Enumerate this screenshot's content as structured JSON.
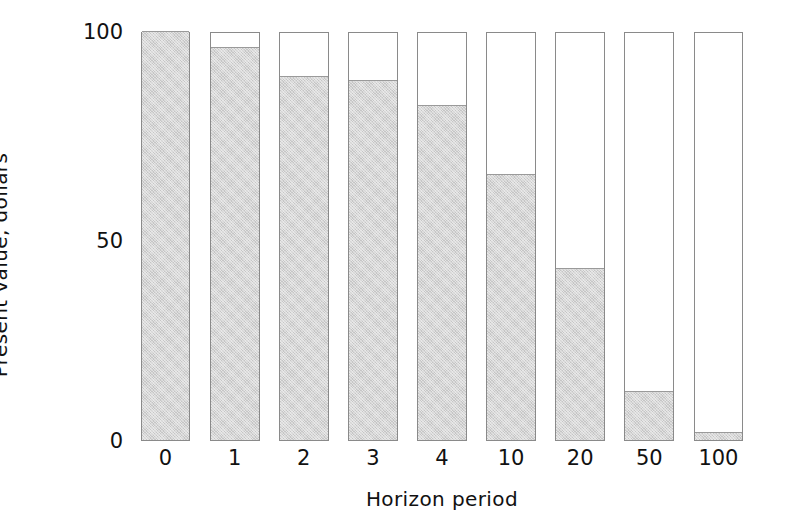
{
  "chart_data": {
    "type": "bar",
    "title": "",
    "subtitle": "",
    "xlabel": "Horizon period",
    "ylabel": "Present value, dollars",
    "categories": [
      "0",
      "1",
      "2",
      "3",
      "4",
      "10",
      "20",
      "50",
      "100"
    ],
    "values": [
      100,
      96,
      89,
      88,
      82,
      65,
      42,
      12,
      2
    ],
    "series": [
      {
        "name": "Present value",
        "values": [
          100,
          96,
          89,
          88,
          82,
          65,
          42,
          12,
          2
        ]
      }
    ],
    "ylim": [
      0,
      100
    ],
    "yticks": [
      0,
      50,
      100
    ],
    "ytick_labels": [
      "0",
      "50",
      "100"
    ],
    "xtick_labels": [
      "0",
      "1",
      "2",
      "3",
      "4",
      "10",
      "20",
      "50",
      "100"
    ],
    "grid": false,
    "legend": "none",
    "bar_style": "outlined-capsule-with-shaded-fill",
    "colors": {
      "fill": "#d6d6d6",
      "outline": "#8a8a8a",
      "background": "#ffffff",
      "text": "#111111"
    },
    "annotations": []
  },
  "axis": {
    "y_title": "Present value, dollars",
    "x_title": "Horizon period",
    "y_tick_0": "0",
    "y_tick_50": "50",
    "y_tick_100": "100"
  }
}
